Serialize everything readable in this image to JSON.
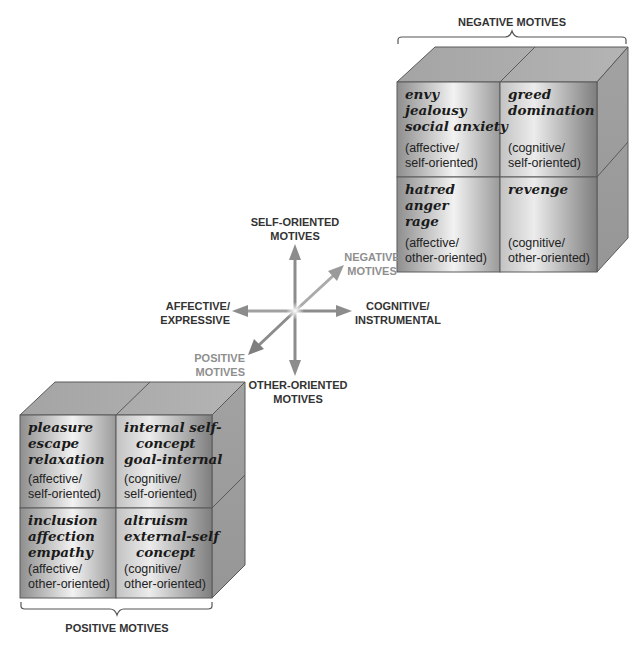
{
  "negative_cube": {
    "title": "NEGATIVE MOTIVES",
    "cells": [
      {
        "lines": [
          "envy",
          "jealousy",
          "social anxiety"
        ],
        "classification": [
          "(affective/",
          "self-oriented)"
        ]
      },
      {
        "lines": [
          "greed",
          "domination"
        ],
        "classification": [
          "(cognitive/",
          "self-oriented)"
        ]
      },
      {
        "lines": [
          "hatred",
          "anger",
          "rage"
        ],
        "classification": [
          "(affective/",
          "other-oriented)"
        ]
      },
      {
        "lines": [
          "revenge"
        ],
        "classification": [
          "(cognitive/",
          "other-oriented)"
        ]
      }
    ]
  },
  "positive_cube": {
    "title": "POSITIVE MOTIVES",
    "cells": [
      {
        "lines": [
          "pleasure",
          "escape",
          "relaxation"
        ],
        "classification": [
          "(affective/",
          "self-oriented)"
        ]
      },
      {
        "lines": [
          "internal self-",
          "concept",
          "goal-internal"
        ],
        "classification": [
          "(cognitive/",
          "self-oriented)"
        ]
      },
      {
        "lines": [
          "inclusion",
          "affection",
          "empathy"
        ],
        "classification": [
          "(affective/",
          "other-oriented)"
        ]
      },
      {
        "lines": [
          "altruism",
          "external-self",
          "concept"
        ],
        "classification": [
          "(cognitive/",
          "other-oriented)"
        ]
      }
    ]
  },
  "axes": {
    "up": [
      "SELF-ORIENTED",
      "MOTIVES"
    ],
    "down": [
      "OTHER-ORIENTED",
      "MOTIVES"
    ],
    "left": [
      "AFFECTIVE/",
      "EXPRESSIVE"
    ],
    "right": [
      "COGNITIVE/",
      "INSTRUMENTAL"
    ],
    "diag_up": [
      "NEGATIVE",
      "MOTIVES"
    ],
    "diag_down": [
      "POSITIVE",
      "MOTIVES"
    ]
  },
  "colors": {
    "face_dark": "#8a8a8a",
    "face_light": "#f4f4f4",
    "top_face": "#a9a9a9",
    "side_face": "#9a9a9a",
    "edge": "#5a5a5a",
    "arrow": "#8c8c8c",
    "grey_label": "#8f8f8f"
  }
}
